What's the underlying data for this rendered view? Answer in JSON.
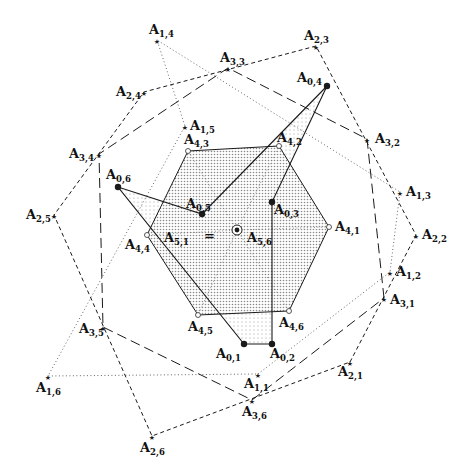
{
  "diagram": {
    "width": 467,
    "height": 473,
    "colors": {
      "ink": "#1a1a1a",
      "hexagon_fill": "#d9d9d9",
      "overlap_fill": "#ececec"
    },
    "points": {
      "A0_1": {
        "label": "A",
        "sub": "0,1",
        "x": 244,
        "y": 344,
        "marker": "dot",
        "lx": -28,
        "ly": 14
      },
      "A0_2": {
        "label": "A",
        "sub": "0,2",
        "x": 272,
        "y": 344,
        "marker": "dot",
        "lx": -2,
        "ly": 14
      },
      "A0_3": {
        "label": "A",
        "sub": "0,3",
        "x": 272,
        "y": 202,
        "marker": "dot",
        "lx": 2,
        "ly": 12
      },
      "A0_4": {
        "label": "A",
        "sub": "0,4",
        "x": 327,
        "y": 86,
        "marker": "dot",
        "lx": -30,
        "ly": -4
      },
      "A0_5": {
        "label": "A",
        "sub": "0,5",
        "x": 202,
        "y": 214,
        "marker": "dot",
        "lx": -16,
        "ly": -6
      },
      "A0_6": {
        "label": "A",
        "sub": "0,6",
        "x": 118,
        "y": 187,
        "marker": "dot",
        "lx": -12,
        "ly": -8
      },
      "A1_1": {
        "label": "A",
        "sub": "1,1",
        "x": 258,
        "y": 374,
        "marker": "star",
        "lx": -14,
        "ly": 14
      },
      "A1_2": {
        "label": "A",
        "sub": "1,2",
        "x": 390,
        "y": 272,
        "marker": "star",
        "lx": 6,
        "ly": 4
      },
      "A1_3": {
        "label": "A",
        "sub": "1,3",
        "x": 400,
        "y": 192,
        "marker": "star",
        "lx": 6,
        "ly": 4
      },
      "A1_4": {
        "label": "A",
        "sub": "1,4",
        "x": 157,
        "y": 40,
        "marker": "star",
        "lx": -8,
        "ly": -6
      },
      "A1_5": {
        "label": "A",
        "sub": "1,5",
        "x": 185,
        "y": 126,
        "marker": "star",
        "lx": 5,
        "ly": 4
      },
      "A1_6": {
        "label": "A",
        "sub": "1,6",
        "x": 48,
        "y": 376,
        "marker": "star",
        "lx": -12,
        "ly": 16
      },
      "A2_1": {
        "label": "A",
        "sub": "2,1",
        "x": 350,
        "y": 362,
        "marker": "star",
        "lx": -12,
        "ly": 14
      },
      "A2_2": {
        "label": "A",
        "sub": "2,2",
        "x": 416,
        "y": 235,
        "marker": "star",
        "lx": 6,
        "ly": 4
      },
      "A2_3": {
        "label": "A",
        "sub": "2,3",
        "x": 316,
        "y": 46,
        "marker": "star",
        "lx": -12,
        "ly": -6
      },
      "A2_4": {
        "label": "A",
        "sub": "2,4",
        "x": 144,
        "y": 92,
        "marker": "star",
        "lx": -28,
        "ly": 4
      },
      "A2_5": {
        "label": "A",
        "sub": "2,5",
        "x": 54,
        "y": 215,
        "marker": "star",
        "lx": -28,
        "ly": 4
      },
      "A2_6": {
        "label": "A",
        "sub": "2,6",
        "x": 152,
        "y": 436,
        "marker": "star",
        "lx": -12,
        "ly": 16
      },
      "A3_1": {
        "label": "A",
        "sub": "3,1",
        "x": 384,
        "y": 298,
        "marker": "star",
        "lx": 6,
        "ly": 6
      },
      "A3_2": {
        "label": "A",
        "sub": "3,2",
        "x": 367,
        "y": 139,
        "marker": "star",
        "lx": 8,
        "ly": 4
      },
      "A3_3": {
        "label": "A",
        "sub": "3,3",
        "x": 228,
        "y": 68,
        "marker": "star",
        "lx": -8,
        "ly": -6
      },
      "A3_4": {
        "label": "A",
        "sub": "3,4",
        "x": 99,
        "y": 154,
        "marker": "star",
        "lx": -30,
        "ly": 4
      },
      "A3_5": {
        "label": "A",
        "sub": "3,5",
        "x": 103,
        "y": 327,
        "marker": "star",
        "lx": -24,
        "ly": 6
      },
      "A3_6": {
        "label": "A",
        "sub": "3,6",
        "x": 252,
        "y": 400,
        "marker": "star",
        "lx": -10,
        "ly": 16
      },
      "A4_1": {
        "label": "A",
        "sub": "4,1",
        "x": 329,
        "y": 227,
        "marker": "circle",
        "lx": 6,
        "ly": 4
      },
      "A4_2": {
        "label": "A",
        "sub": "4,2",
        "x": 279,
        "y": 146,
        "marker": "circle",
        "lx": -2,
        "ly": -4
      },
      "A4_3": {
        "label": "A",
        "sub": "4,3",
        "x": 188,
        "y": 151,
        "marker": "circle",
        "lx": -4,
        "ly": -7
      },
      "A4_4": {
        "label": "A",
        "sub": "4,4",
        "x": 147,
        "y": 235,
        "marker": "circle",
        "lx": -22,
        "ly": 14
      },
      "A4_5": {
        "label": "A",
        "sub": "4,5",
        "x": 198,
        "y": 315,
        "marker": "circle",
        "lx": -10,
        "ly": 16
      },
      "A4_6": {
        "label": "A",
        "sub": "4,6",
        "x": 289,
        "y": 311,
        "marker": "circle",
        "lx": -10,
        "ly": 16
      },
      "A5": {
        "label": "A",
        "sub": "5,6",
        "x": 237,
        "y": 230,
        "marker": "target",
        "lx": 10,
        "ly": 12
      }
    },
    "extra_labels": [
      {
        "label": "A",
        "sub": "5,1",
        "x": 164,
        "y": 242
      },
      {
        "label": "=",
        "sub": "",
        "x": 204,
        "y": 240
      }
    ],
    "hexagon_A4": [
      "A4_1",
      "A4_2",
      "A4_3",
      "A4_4",
      "A4_5",
      "A4_6"
    ],
    "polygon_A0": [
      "A0_1",
      "A0_2",
      "A0_3",
      "A0_4",
      "A0_5",
      "A0_6"
    ],
    "polygon_A1_dotted": [
      "A1_1",
      "A1_2",
      "A1_3",
      "A1_4",
      "A1_5",
      "A1_6"
    ],
    "polygon_A2_dashed": [
      "A2_1",
      "A2_2",
      "A2_3",
      "A2_4",
      "A2_5",
      "A2_6"
    ],
    "polygon_A3_longdash": [
      "A3_1",
      "A3_2",
      "A3_3",
      "A3_4",
      "A3_5",
      "A3_6"
    ],
    "spokes_A4_dotted": [
      "A4_1",
      "A4_2",
      "A4_3",
      "A4_4",
      "A4_5",
      "A4_6"
    ]
  }
}
